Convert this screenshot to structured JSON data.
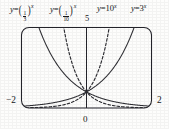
{
  "figure": {
    "background_color": "#fdfdfc",
    "ink_color": "#16161a"
  },
  "labels": {
    "eq_one": {
      "lhs": "y",
      "eq": "=",
      "num": "1",
      "den": "3",
      "exp": "x"
    },
    "eq_two": {
      "lhs": "y",
      "eq": "=",
      "num": "1",
      "den": "10",
      "exp": "x"
    },
    "eq_three": {
      "lhs": "y",
      "eq": "=",
      "base": "10",
      "exp": "x"
    },
    "eq_four": {
      "lhs": "y",
      "eq": "=",
      "base": "3",
      "exp": "x"
    }
  },
  "axes": {
    "y_top_tick": "5",
    "x_left_tick": "−2",
    "x_origin_tick": "0",
    "x_right_tick": "2"
  },
  "chart_data": {
    "type": "line",
    "title": "",
    "xlabel": "",
    "ylabel": "",
    "xlim": [
      -2,
      2
    ],
    "ylim": [
      0,
      5
    ],
    "grid": false,
    "legend_position": "above-plot",
    "frame": {
      "rounded_corners": true,
      "y_axis_at_x": 0
    },
    "x": [
      -2,
      -1.75,
      -1.5,
      -1.25,
      -1,
      -0.75,
      -0.5,
      -0.25,
      0,
      0.25,
      0.5,
      0.75,
      1,
      1.25,
      1.5,
      1.75,
      2
    ],
    "series": [
      {
        "name": "y = (1/3)^x",
        "base": 0.3333,
        "style": "solid",
        "color": "#2e2e33",
        "values": [
          9,
          6.84,
          5.2,
          3.95,
          3,
          2.28,
          1.73,
          1.32,
          1,
          0.76,
          0.577,
          0.439,
          0.333,
          0.253,
          0.192,
          0.146,
          0.111
        ]
      },
      {
        "name": "y = (1/10)^x",
        "base": 0.1,
        "style": "dashed",
        "color": "#2e2e33",
        "values": [
          100,
          56.2,
          31.6,
          17.8,
          10,
          5.62,
          3.16,
          1.78,
          1,
          0.562,
          0.316,
          0.178,
          0.1,
          0.0562,
          0.0316,
          0.0178,
          0.01
        ]
      },
      {
        "name": "y = 10^x",
        "base": 10,
        "style": "dashed",
        "color": "#2e2e33",
        "values": [
          0.01,
          0.0178,
          0.0316,
          0.0562,
          0.1,
          0.178,
          0.316,
          0.562,
          1,
          1.78,
          3.16,
          5.62,
          10,
          17.8,
          31.6,
          56.2,
          100
        ]
      },
      {
        "name": "y = 3^x",
        "base": 3,
        "style": "solid",
        "color": "#2e2e33",
        "values": [
          0.111,
          0.146,
          0.192,
          0.253,
          0.333,
          0.439,
          0.577,
          0.76,
          1,
          1.32,
          1.73,
          2.28,
          3,
          3.95,
          5.2,
          6.84,
          9
        ]
      }
    ],
    "annotations": [
      {
        "text": "all curves pass through (0, 1)",
        "x": 0,
        "y": 1
      }
    ]
  }
}
